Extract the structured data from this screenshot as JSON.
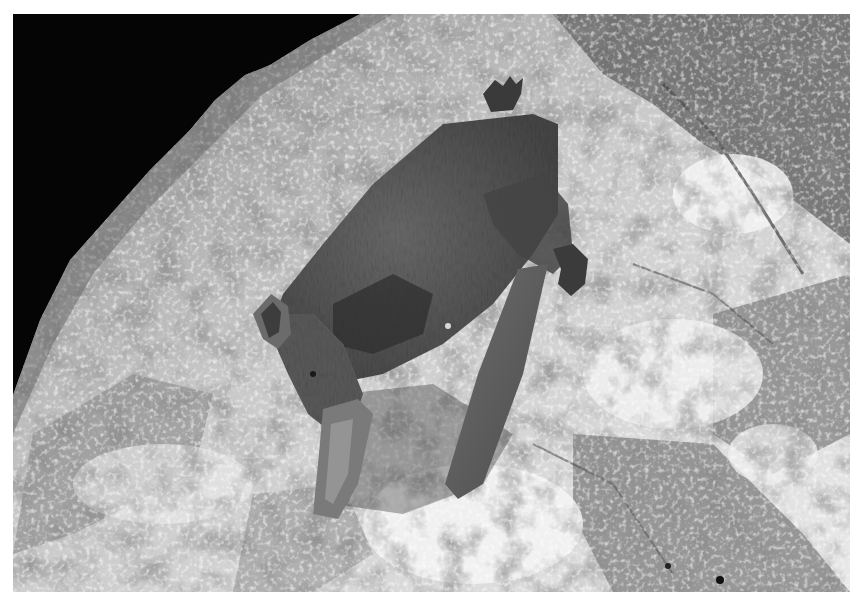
{
  "image": {
    "subject": "bat",
    "description": "Grayscale night photograph of a small bat clinging head-down to a lichen-covered rock, black sky in upper-left corner",
    "alt": "Bat hanging on a lichen-covered boulder at night"
  },
  "palette": {
    "sky": "#050505",
    "rock_light": "#e6e6e6",
    "rock_mid": "#9a9a9a",
    "rock_dark": "#4a4a4a",
    "bat_fur": "#5e5e5e",
    "bat_dark": "#353535",
    "border": "#ffffff"
  }
}
